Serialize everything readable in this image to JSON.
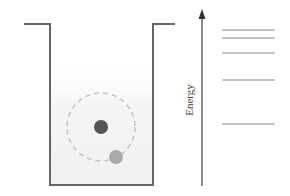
{
  "diagram": {
    "title": "",
    "axis": {
      "label": "Energy",
      "direction": "up"
    },
    "well": {
      "type": "finite-potential-well",
      "wall_color": "#666666",
      "fill_color": "#f3f3f3"
    },
    "atom": {
      "nucleus_color": "#555555",
      "electron_color": "#aaaaaa",
      "orbit_color": "#bbbbbb",
      "orbit_style": "dashed"
    },
    "energy_levels": {
      "count": 5,
      "color": "#888888",
      "levels": [
        {
          "index": 1,
          "y": 124
        },
        {
          "index": 2,
          "y": 80
        },
        {
          "index": 3,
          "y": 53
        },
        {
          "index": 4,
          "y": 38
        },
        {
          "index": 5,
          "y": 30
        }
      ]
    }
  }
}
